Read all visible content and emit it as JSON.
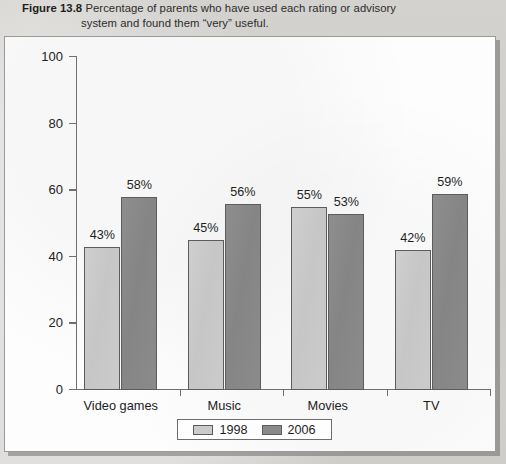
{
  "caption": {
    "figure_label": "Figure 13.8",
    "line1": "Percentage of parents who have used each rating or advisory",
    "line2": "system and found them “very” useful."
  },
  "colors": {
    "series_1998": "#cbcbcb",
    "series_2006": "#8a8a8a",
    "axis": "#6f6f6f",
    "page_background": "#d9d7d4",
    "panel_background": "#fdfdfd"
  },
  "chart_data": {
    "type": "bar",
    "title": "Percentage of parents who have used each rating or advisory system and found them “very” useful.",
    "categories": [
      "Video games",
      "Music",
      "Movies",
      "TV"
    ],
    "series": [
      {
        "name": "1998",
        "values": [
          43,
          45,
          55,
          42
        ],
        "color": "#cbcbcb"
      },
      {
        "name": "2006",
        "values": [
          58,
          56,
          53,
          59
        ],
        "color": "#8a8a8a"
      }
    ],
    "data_labels": [
      [
        "43%",
        "45%",
        "55%",
        "42%"
      ],
      [
        "58%",
        "56%",
        "53%",
        "59%"
      ]
    ],
    "xlabel": "",
    "ylabel": "",
    "ylim": [
      0,
      100
    ],
    "yticks": [
      0,
      20,
      40,
      60,
      80,
      100
    ],
    "ytick_labels": [
      "0",
      "20",
      "40",
      "60",
      "80",
      "100"
    ],
    "grid": false,
    "legend_position": "bottom"
  },
  "legend": {
    "items": [
      {
        "label": "1998"
      },
      {
        "label": "2006"
      }
    ]
  }
}
